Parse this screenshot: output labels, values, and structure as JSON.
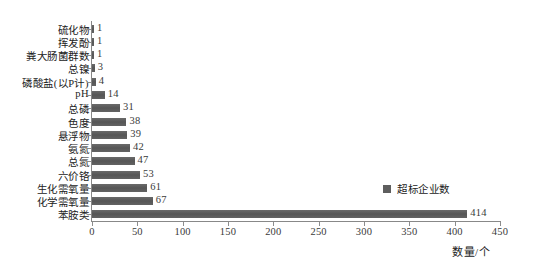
{
  "chart_data": {
    "type": "bar",
    "orientation": "horizontal",
    "title": "",
    "xlabel": "数量/个",
    "ylabel": "",
    "xlim": [
      0,
      450
    ],
    "xticks": [
      0,
      50,
      100,
      150,
      200,
      250,
      300,
      350,
      400,
      450
    ],
    "xtick_labels": [
      "0",
      "50",
      "100",
      "150",
      "200",
      "250",
      "300",
      "350",
      "400",
      "450"
    ],
    "grid": false,
    "legend": {
      "position": "inside-right",
      "entries": [
        {
          "name": "超标企业数",
          "color": "#5e5e5e"
        }
      ]
    },
    "series": [
      {
        "name": "超标企业数",
        "color": "#5e5e5e",
        "values": [
          1,
          1,
          1,
          3,
          4,
          14,
          31,
          38,
          39,
          42,
          47,
          53,
          61,
          67,
          414
        ]
      }
    ],
    "categories": [
      "硫化物",
      "挥发酚",
      "粪大肠菌群数",
      "总镍",
      "磷酸盐(以P计)",
      "pH",
      "总磷",
      "色度",
      "悬浮物",
      "氨氮",
      "总氮",
      "六价铬",
      "生化需氧量",
      "化学需氧量",
      "苯胺类"
    ],
    "data_labels": [
      "1",
      "1",
      "1",
      "3",
      "4",
      "14",
      "31",
      "38",
      "39",
      "42",
      "47",
      "53",
      "61",
      "67",
      "414"
    ]
  },
  "colors": {
    "bar": "#5e5e5e",
    "axis": "#888888",
    "text": "#222222",
    "background": "#ffffff"
  }
}
